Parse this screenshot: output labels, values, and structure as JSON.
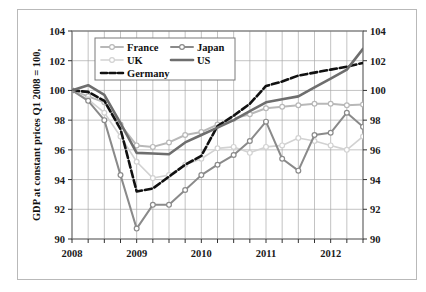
{
  "figure": {
    "background_color": "#ffffff",
    "frame_color": "#b9b9b9"
  },
  "chart_data": {
    "type": "line",
    "title": "",
    "subtitle": "",
    "xlabel": "",
    "ylabel": "GDP at constant prices Q1 2008 = 100,",
    "ylim": [
      90,
      104
    ],
    "ytick_labels": [
      "90",
      "92",
      "94",
      "96",
      "98",
      "100",
      "102",
      "104"
    ],
    "ytick_values": [
      90,
      92,
      94,
      96,
      98,
      100,
      102,
      104
    ],
    "right_axis": true,
    "right_ytick_labels": [
      "90",
      "92",
      "94",
      "96",
      "98",
      "100",
      "102",
      "104"
    ],
    "xtick_labels": [
      "2008",
      "2009",
      "2010",
      "2011",
      "2012"
    ],
    "xtick_values": [
      0,
      4,
      8,
      12,
      16
    ],
    "minor_x_gridlines": true,
    "grid": true,
    "grid_color": "#a9a9a9",
    "legend_position": "upper-left-inside",
    "x": [
      0,
      1,
      2,
      3,
      4,
      5,
      6,
      7,
      8,
      9,
      10,
      11,
      12,
      13,
      14,
      15,
      16,
      17,
      18
    ],
    "x_quarter_labels": [
      "2008Q1",
      "2008Q2",
      "2008Q3",
      "2008Q4",
      "2009Q1",
      "2009Q2",
      "2009Q3",
      "2009Q4",
      "2010Q1",
      "2010Q2",
      "2010Q3",
      "2010Q4",
      "2011Q1",
      "2011Q2",
      "2011Q3",
      "2011Q4",
      "2012Q1",
      "2012Q2",
      "2012Q3"
    ],
    "series": [
      {
        "name": "France",
        "color": "#b8b8b8",
        "line_style": "solid",
        "line_width": 2.0,
        "marker": "circle",
        "values": [
          100.0,
          99.6,
          99.2,
          97.7,
          96.3,
          96.2,
          96.5,
          97.0,
          97.2,
          97.7,
          98.1,
          98.4,
          98.8,
          98.9,
          99.0,
          99.1,
          99.1,
          99.0,
          99.05
        ]
      },
      {
        "name": "UK",
        "color": "#d2d2d2",
        "line_style": "solid",
        "line_width": 1.6,
        "marker": "circle",
        "values": [
          100.0,
          99.4,
          98.5,
          96.9,
          95.2,
          94.1,
          94.3,
          95.0,
          95.4,
          96.1,
          96.2,
          95.8,
          96.2,
          96.3,
          96.8,
          96.6,
          96.3,
          96.0,
          96.9
        ]
      },
      {
        "name": "Germany",
        "color": "#111111",
        "line_style": "dashed",
        "line_width": 2.6,
        "marker": "none",
        "values": [
          100.0,
          99.9,
          99.3,
          97.4,
          93.2,
          93.4,
          94.2,
          95.0,
          95.6,
          97.6,
          98.3,
          99.1,
          100.3,
          100.6,
          101.0,
          101.2,
          101.4,
          101.6,
          101.85
        ]
      },
      {
        "name": "Japan",
        "color": "#8a8a8a",
        "line_style": "solid",
        "line_width": 2.0,
        "marker": "circle",
        "values": [
          100.0,
          99.3,
          98.0,
          94.3,
          90.7,
          92.3,
          92.3,
          93.3,
          94.3,
          95.0,
          95.65,
          96.6,
          97.9,
          95.4,
          94.6,
          97.0,
          97.15,
          98.5,
          97.55
        ]
      },
      {
        "name": "US",
        "color": "#6e6e6e",
        "line_style": "solid",
        "line_width": 2.6,
        "marker": "none",
        "values": [
          100.0,
          100.35,
          99.7,
          97.8,
          95.8,
          95.75,
          95.7,
          96.5,
          97.0,
          97.5,
          98.0,
          98.6,
          99.2,
          99.4,
          99.6,
          100.2,
          100.8,
          101.4,
          102.8
        ]
      }
    ]
  },
  "legend": {
    "entries": [
      {
        "label": "France"
      },
      {
        "label": "Japan"
      },
      {
        "label": "UK"
      },
      {
        "label": "US"
      },
      {
        "label": "Germany"
      }
    ]
  }
}
